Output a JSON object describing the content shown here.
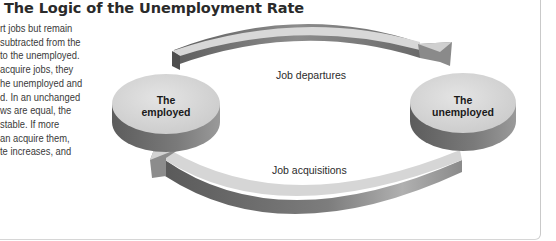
{
  "figure": {
    "title": "The Logic of the Unemployment Rate",
    "body_text_lines": [
      "rt jobs but remain",
      " subtracted from the",
      "to the unemployed.",
      " acquire jobs, they",
      "he unemployed and",
      "d. In an unchanged",
      "ws are equal, the",
      " stable. If more",
      "an acquire them,",
      "te increases, and"
    ]
  },
  "diagram": {
    "nodes": [
      {
        "id": "employed",
        "line1": "The",
        "line2": "employed"
      },
      {
        "id": "unemployed",
        "line1": "The",
        "line2": "unemployed"
      }
    ],
    "flows": [
      {
        "from": "employed",
        "to": "unemployed",
        "label": "Job departures"
      },
      {
        "from": "unemployed",
        "to": "employed",
        "label": "Job acquisitions"
      }
    ],
    "colors": {
      "disk_top": "#d9d9d9",
      "disk_side_dark": "#6e6e6e",
      "arrow_top": "#cfcfcf",
      "arrow_side": "#8a8a8a"
    }
  }
}
